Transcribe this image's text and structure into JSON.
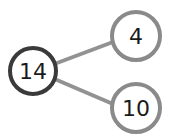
{
  "diagram": {
    "type": "number-bond",
    "whole": {
      "label": "14",
      "border_color": "#3a3a3a"
    },
    "parts": [
      {
        "label": "4",
        "border_color": "#8a8a8a"
      },
      {
        "label": "10",
        "border_color": "#8a8a8a"
      }
    ],
    "connector_color": "#929292"
  }
}
